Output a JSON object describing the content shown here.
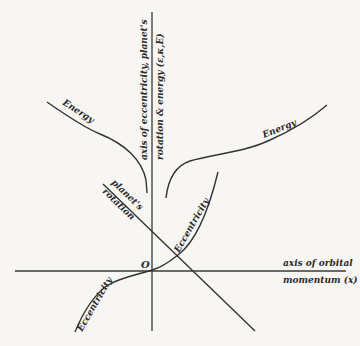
{
  "figure": {
    "vertical_axis_label_line1": "axis of eccentricity, planet's",
    "vertical_axis_label_line2": "rotation & energy (ε,κ,E)",
    "horizontal_axis_label_line1": "axis of orbital",
    "horizontal_axis_label_line2": "momentum (x)",
    "origin_label": "O",
    "curves": {
      "energy_left": "Energy",
      "energy_right": "Energy",
      "rotation_line1": "planet's",
      "rotation_line2": "rotation",
      "eccentricity_upper": "Eccentricity",
      "eccentricity_lower": "Eccentricity"
    }
  }
}
